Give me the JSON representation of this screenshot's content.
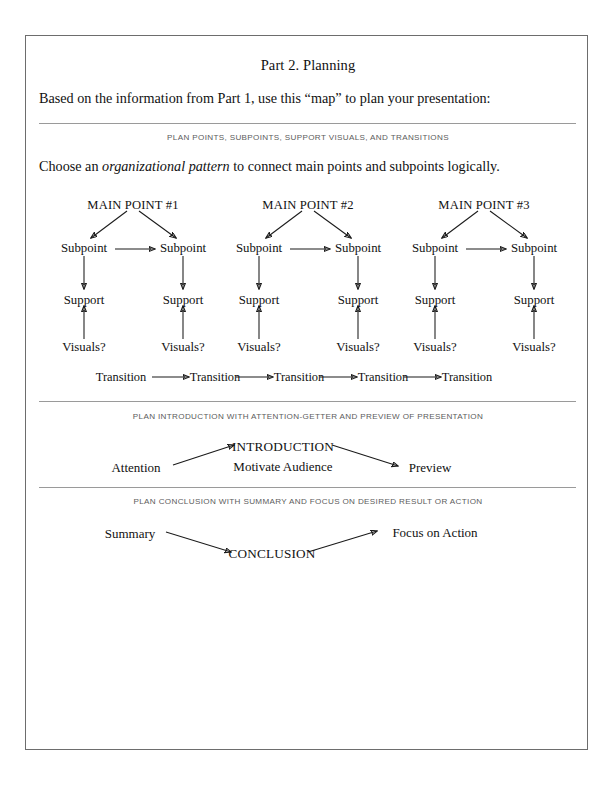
{
  "document": {
    "title": "Part 2.  Planning",
    "intro_line": "Based on the information from Part 1, use this “map” to plan your presentation:"
  },
  "sections": {
    "points": {
      "caption": "PLAN POINTS, SUBPOINTS, SUPPORT VISUALS, AND TRANSITIONS",
      "instruction_before": "Choose an ",
      "instruction_emphasis": "organizational pattern",
      "instruction_after": " to connect main points and subpoints logically.",
      "columns": [
        {
          "main_point": "MAIN POINT #1",
          "left": {
            "subpoint": "Subpoint",
            "support": "Support",
            "visuals": "Visuals?"
          },
          "right": {
            "subpoint": "Subpoint",
            "support": "Support",
            "visuals": "Visuals?"
          }
        },
        {
          "main_point": "MAIN POINT #2",
          "left": {
            "subpoint": "Subpoint",
            "support": "Support",
            "visuals": "Visuals?"
          },
          "right": {
            "subpoint": "Subpoint",
            "support": "Support",
            "visuals": "Visuals?"
          }
        },
        {
          "main_point": "MAIN POINT #3",
          "left": {
            "subpoint": "Subpoint",
            "support": "Support",
            "visuals": "Visuals?"
          },
          "right": {
            "subpoint": "Subpoint",
            "support": "Support",
            "visuals": "Visuals?"
          }
        }
      ],
      "transitions": [
        "Transition",
        "Transition",
        "Transition",
        "Transition",
        "Transition"
      ]
    },
    "introduction": {
      "caption": "PLAN INTRODUCTION WITH ATTENTION-GETTER AND PREVIEW OF PRESENTATION",
      "attention": "Attention",
      "heading": "INTRODUCTION",
      "subheading": "Motivate Audience",
      "preview": "Preview"
    },
    "conclusion": {
      "caption": "PLAN CONCLUSION WITH SUMMARY AND FOCUS ON DESIRED RESULT OR ACTION",
      "summary": "Summary",
      "heading": "CONCLUSION",
      "focus": "Focus on Action"
    }
  },
  "style": {
    "ink": "#1a1a1a",
    "rule_color": "#9a9a9a",
    "caption_color": "#5c5c5c",
    "border_color": "#6d6d6d",
    "paper": "#ffffff"
  }
}
